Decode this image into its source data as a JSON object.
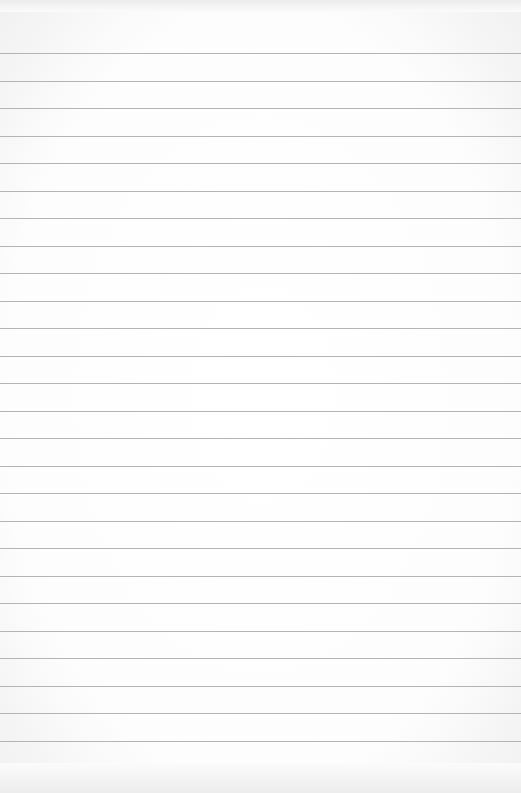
{
  "page": {
    "type": "blank-lined-paper",
    "rule_count": 26,
    "first_rule_y": 53,
    "rule_spacing": 27.5,
    "colors": {
      "paper": "#ffffff",
      "rule": "#b4b4b4",
      "edge": "#ececec"
    }
  }
}
